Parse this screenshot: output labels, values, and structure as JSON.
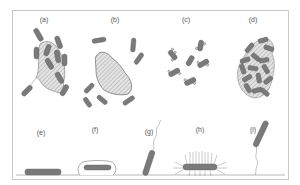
{
  "figure": {
    "panels": [
      {
        "id": "a",
        "label": "(a)",
        "x": 44,
        "y": 16,
        "description": "rod cells attached to hatched particle, one free cell attached by fibril"
      },
      {
        "id": "b",
        "label": "(b)",
        "x": 115,
        "y": 16,
        "description": "free rod cells around a hatched particle"
      },
      {
        "id": "c",
        "label": "(c)",
        "x": 186,
        "y": 16,
        "description": "small rod cells with surface blebs/particles"
      },
      {
        "id": "d",
        "label": "(d)",
        "x": 253,
        "y": 16,
        "description": "dense aggregate of rod cells and hatched particles"
      },
      {
        "id": "e",
        "label": "(e)",
        "x": 41,
        "y": 129,
        "description": "flattened cell lying on surface"
      },
      {
        "id": "f",
        "label": "(f)",
        "x": 95,
        "y": 126,
        "description": "cell enclosed in capsule on surface"
      },
      {
        "id": "g",
        "label": "(g)",
        "x": 149,
        "y": 128,
        "description": "cell attached at one pole with flagellum"
      },
      {
        "id": "h",
        "label": "(h)",
        "x": 200,
        "y": 126,
        "description": "cell with peritrichous fimbriae on surface"
      },
      {
        "id": "i",
        "label": "(i)",
        "x": 253,
        "y": 126,
        "description": "cell attached to surface via holdfast fibril"
      }
    ],
    "colors": {
      "cell_fill": "#7a7a7a",
      "cell_stroke": "#5a5a5a",
      "particle_fill": "#dcdcdc",
      "hatch": "#9a9a9a",
      "frame": "#c8c8c8",
      "line": "#888888"
    }
  }
}
